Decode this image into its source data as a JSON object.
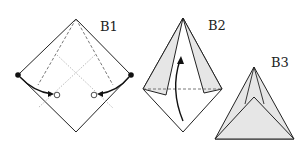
{
  "figure": {
    "type": "origami-fold-steps",
    "steps": [
      {
        "id": "b1",
        "label": "B1"
      },
      {
        "id": "b2",
        "label": "B2"
      },
      {
        "id": "b3",
        "label": "B3"
      }
    ],
    "colors": {
      "line": "#222222",
      "shade": "#e6e6e6",
      "dotted": "#aaaaaa",
      "background": "#ffffff"
    }
  }
}
